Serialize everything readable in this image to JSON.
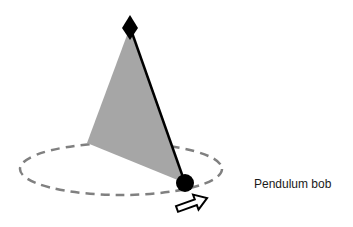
{
  "diagram": {
    "labels": {
      "bob": "Pendulum bob"
    },
    "colors": {
      "background": "#ffffff",
      "cone_fill": "#a6a6a6",
      "rod": "#000000",
      "bob": "#000000",
      "pivot": "#000000",
      "orbit_dash": "#808080",
      "arrow_stroke": "#000000",
      "arrow_fill": "#ffffff"
    },
    "geometry": {
      "pivot": {
        "x": 130,
        "y": 27
      },
      "bob": {
        "x": 185,
        "y": 183,
        "r": 9
      },
      "orbit": {
        "cx": 121,
        "cy": 169,
        "rx": 101,
        "ry": 26
      },
      "cone_left": {
        "x": 87,
        "y": 143
      }
    }
  }
}
